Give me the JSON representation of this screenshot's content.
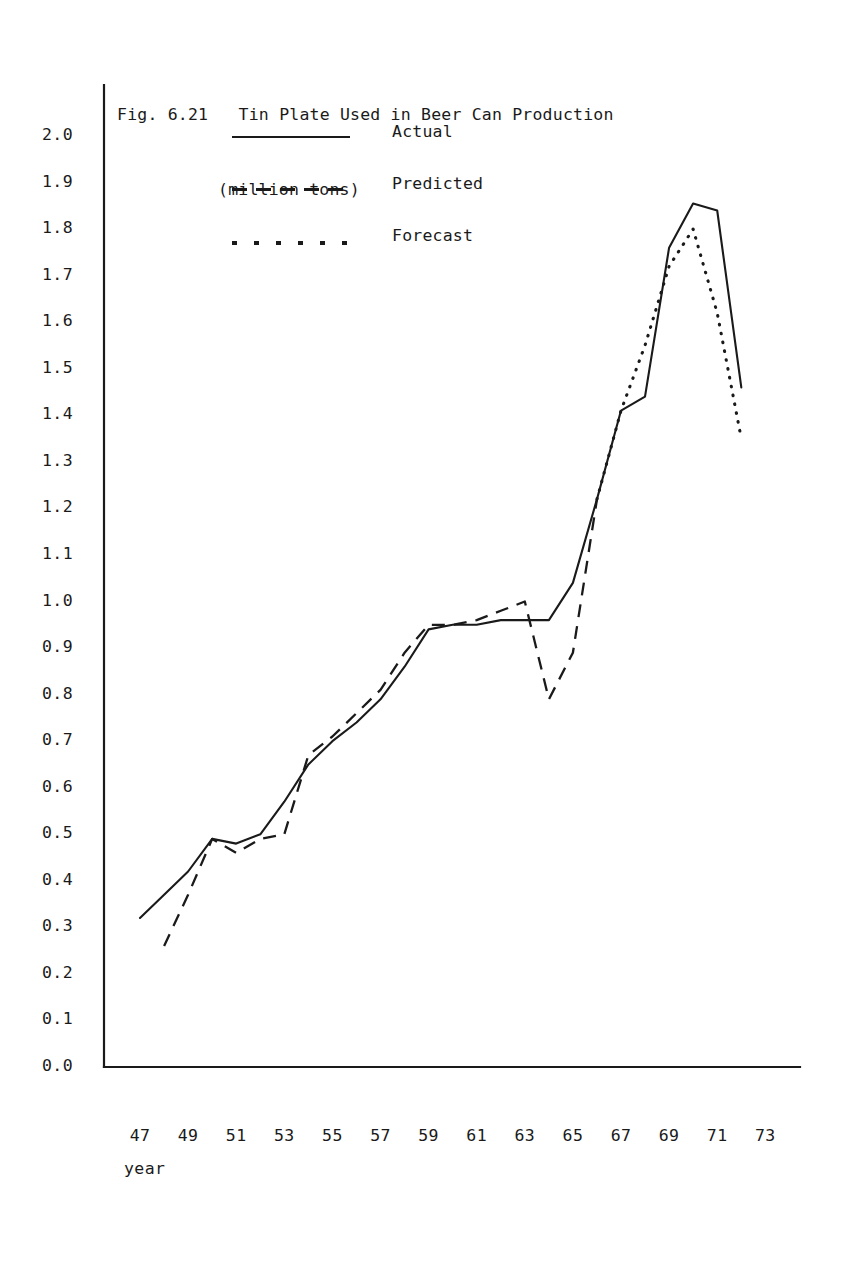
{
  "figure": {
    "label": "Fig. 6.21",
    "title": "Tin Plate Used in Beer Can Production",
    "subtitle": "(million tons)",
    "title_full": "Fig. 6.21   Tin Plate Used in Beer Can Production"
  },
  "legend": {
    "position": "inside-top-left",
    "items": [
      {
        "key": "solid-line-key",
        "label": "Actual"
      },
      {
        "key": "dashed-line-key",
        "label": "Predicted"
      },
      {
        "key": "dotted-line-key",
        "label": "Forecast"
      }
    ]
  },
  "axes": {
    "x_label": "year",
    "y_ticks": [
      "2.0",
      "1.9",
      "1.8",
      "1.7",
      "1.6",
      "1.5",
      "1.4",
      "1.3",
      "1.2",
      "1.1",
      "1.0",
      "0.9",
      "0.8",
      "0.7",
      "0.6",
      "0.5",
      "0.4",
      "0.3",
      "0.2",
      "0.1",
      "0.0"
    ],
    "x_ticks": [
      "47",
      "49",
      "51",
      "53",
      "55",
      "57",
      "59",
      "61",
      "63",
      "65",
      "67",
      "69",
      "71",
      "73"
    ]
  },
  "colors": {
    "ink": "#1a1a1a",
    "background": "#ffffff"
  },
  "chart_data": {
    "type": "line",
    "title": "Tin Plate Used in Beer Can Production (million tons)",
    "xlabel": "year",
    "ylabel": "million tons",
    "xlim": [
      46,
      74
    ],
    "ylim": [
      0.0,
      2.0
    ],
    "grid": false,
    "legend_position": "top-left",
    "x_tick_values": [
      47,
      49,
      51,
      53,
      55,
      57,
      59,
      61,
      63,
      65,
      67,
      69,
      71,
      73
    ],
    "y_tick_values": [
      0.0,
      0.1,
      0.2,
      0.3,
      0.4,
      0.5,
      0.6,
      0.7,
      0.8,
      0.9,
      1.0,
      1.1,
      1.2,
      1.3,
      1.4,
      1.5,
      1.6,
      1.7,
      1.8,
      1.9,
      2.0
    ],
    "series": [
      {
        "name": "Actual",
        "style": "solid",
        "x": [
          47,
          48,
          49,
          50,
          51,
          52,
          53,
          54,
          55,
          56,
          57,
          58,
          59,
          60,
          61,
          62,
          63,
          64,
          65,
          66,
          67,
          68,
          69,
          70,
          71,
          72
        ],
        "values": [
          0.32,
          0.37,
          0.42,
          0.49,
          0.48,
          0.5,
          0.57,
          0.65,
          0.7,
          0.74,
          0.79,
          0.86,
          0.94,
          0.95,
          0.95,
          0.96,
          0.96,
          0.96,
          1.04,
          1.22,
          1.41,
          1.44,
          1.76,
          1.855,
          1.84,
          1.46
        ]
      },
      {
        "name": "Predicted",
        "style": "dashed",
        "x": [
          48,
          49,
          50,
          51,
          52,
          53,
          54,
          55,
          56,
          57,
          58,
          59,
          60,
          61,
          62,
          63,
          64,
          65,
          66
        ],
        "values": [
          0.26,
          0.37,
          0.49,
          0.46,
          0.49,
          0.5,
          0.67,
          0.71,
          0.76,
          0.81,
          0.89,
          0.95,
          0.95,
          0.96,
          0.98,
          1.0,
          0.79,
          0.89,
          1.22
        ]
      },
      {
        "name": "Forecast",
        "style": "dotted",
        "x": [
          66,
          67,
          68,
          69,
          70,
          71,
          72
        ],
        "values": [
          1.22,
          1.41,
          1.55,
          1.72,
          1.8,
          1.62,
          1.35
        ]
      }
    ]
  }
}
